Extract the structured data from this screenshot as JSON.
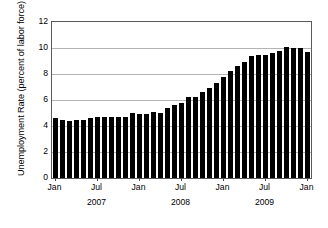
{
  "chart_data": {
    "type": "bar",
    "title": "",
    "subtitle": "",
    "xlabel": "",
    "ylabel": "Unemployment Rate (percent of labor force)",
    "ylim": [
      0,
      12
    ],
    "yticks": [
      0,
      2,
      4,
      6,
      8,
      10,
      12
    ],
    "ytick_labels": [
      "0",
      "2",
      "4",
      "6",
      "8",
      "10",
      "12"
    ],
    "grid": "horizontal",
    "legend": null,
    "bar_color": "#000000",
    "gridline_color": "#b4b4b4",
    "frame_color": "#5a5a5a",
    "background_color": "#ffffff",
    "x_tick_labels": [
      "Jan",
      "Jul",
      "Jan",
      "Jul",
      "Jan",
      "Jul",
      "Jan"
    ],
    "x_tick_months": [
      "2007-01",
      "2007-07",
      "2008-01",
      "2008-07",
      "2009-01",
      "2009-07",
      "2010-01"
    ],
    "year_labels": [
      "2007",
      "2008",
      "2009"
    ],
    "year_label_months": [
      "2007-07",
      "2008-07",
      "2009-07"
    ],
    "categories": [
      "Jan 2007",
      "Feb 2007",
      "Mar 2007",
      "Apr 2007",
      "May 2007",
      "Jun 2007",
      "Jul 2007",
      "Aug 2007",
      "Sep 2007",
      "Oct 2007",
      "Nov 2007",
      "Dec 2007",
      "Jan 2008",
      "Feb 2008",
      "Mar 2008",
      "Apr 2008",
      "May 2008",
      "Jun 2008",
      "Jul 2008",
      "Aug 2008",
      "Sep 2008",
      "Oct 2008",
      "Nov 2008",
      "Dec 2008",
      "Jan 2009",
      "Feb 2009",
      "Mar 2009",
      "Apr 2009",
      "May 2009",
      "Jun 2009",
      "Jul 2009",
      "Aug 2009",
      "Sep 2009",
      "Oct 2009",
      "Nov 2009",
      "Dec 2009",
      "Jan 2010"
    ],
    "values": [
      4.6,
      4.5,
      4.4,
      4.5,
      4.5,
      4.6,
      4.7,
      4.7,
      4.7,
      4.7,
      4.7,
      5.0,
      4.9,
      4.9,
      5.1,
      5.0,
      5.4,
      5.6,
      5.8,
      6.2,
      6.2,
      6.6,
      6.9,
      7.3,
      7.8,
      8.2,
      8.6,
      8.9,
      9.4,
      9.5,
      9.5,
      9.6,
      9.8,
      10.1,
      10.0,
      10.0,
      9.7
    ]
  }
}
